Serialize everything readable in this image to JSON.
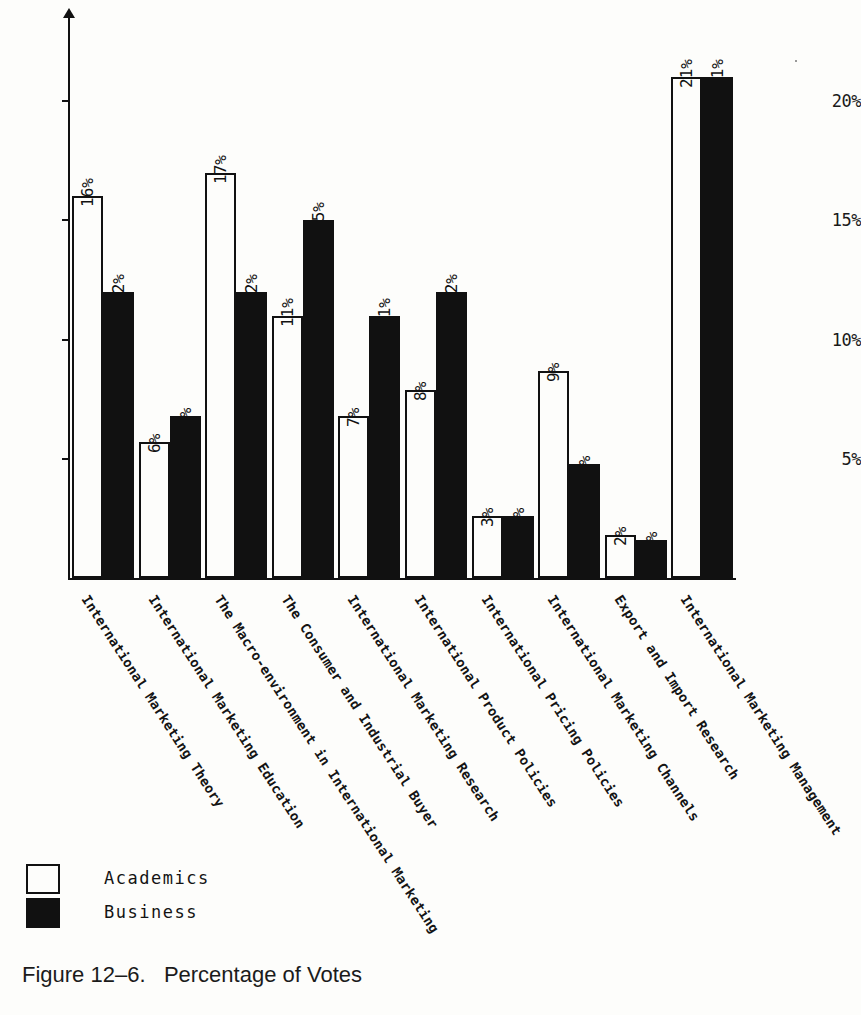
{
  "figure": {
    "caption_number": "Figure 12–6.",
    "caption_title": "Percentage of Votes"
  },
  "legend": {
    "position": "bottom-left",
    "entries": [
      {
        "label": "Academics",
        "swatch": "white-outlined-square"
      },
      {
        "label": "Business",
        "swatch": "black-filled-square"
      }
    ]
  },
  "axis": {
    "y_ticks": [
      "5%",
      "10%",
      "15%",
      "20%"
    ],
    "y_tick_values": [
      5,
      10,
      15,
      20
    ]
  },
  "chart_data": {
    "type": "bar",
    "title": "Percentage of Votes",
    "xlabel": "",
    "ylabel": "",
    "ylim": [
      0,
      23
    ],
    "grid": false,
    "legend_position": "bottom-left",
    "y_tick_labels": [
      "5%",
      "10%",
      "15%",
      "20%"
    ],
    "value_label_suffix": "%",
    "categories": [
      "International Marketing Theory",
      "International Marketing Education",
      "The Macro-environment in International Marketing",
      "The Consumer and Industrial Buyer",
      "International Marketing Research",
      "International Product Policies",
      "International Pricing Policies",
      "International Marketing Channels",
      "Export and Import Research",
      "International Marketing Management"
    ],
    "series": [
      {
        "name": "Academics",
        "color": "#ffffff",
        "edge_color": "#111111",
        "values": [
          16,
          6,
          17,
          11,
          7,
          8,
          3,
          9,
          2,
          21
        ],
        "labels": [
          "16%",
          "6%",
          "17%",
          "11%",
          "7%",
          "8%",
          "3%",
          "9%",
          "2%",
          "21%"
        ],
        "drawn_heights": [
          16.0,
          5.7,
          17.0,
          11.0,
          6.8,
          7.9,
          2.6,
          8.7,
          1.8,
          21.0
        ]
      },
      {
        "name": "Business",
        "color": "#111111",
        "edge_color": "#111111",
        "values": [
          12,
          7,
          12,
          15,
          11,
          12,
          3,
          5,
          2,
          21
        ],
        "labels": [
          "12%",
          "7%",
          "12%",
          "15%",
          "11%",
          "12%",
          "3%",
          "5%",
          "2%",
          "21%"
        ],
        "drawn_heights": [
          12.0,
          6.8,
          12.0,
          15.0,
          11.0,
          12.0,
          2.6,
          4.8,
          1.6,
          21.0
        ]
      }
    ]
  }
}
